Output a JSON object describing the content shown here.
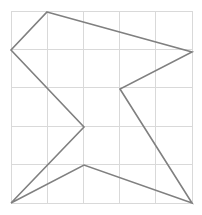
{
  "figure": {
    "name": "polygon-on-grid",
    "width": 202,
    "height": 215,
    "background_color": "#ffffff"
  },
  "chart_data": {
    "type": "scatter",
    "title": "",
    "subtitle": "",
    "xlabel": "",
    "ylabel": "",
    "grid": true,
    "legend": null,
    "legend_position": "none",
    "xlim": [
      0,
      5
    ],
    "ylim": [
      0,
      5
    ],
    "xticks": [
      0,
      1,
      2,
      3,
      4,
      5
    ],
    "yticks": [
      0,
      1,
      2,
      3,
      4,
      5
    ],
    "xticklabels": [
      "",
      "",
      "",
      "",
      "",
      ""
    ],
    "yticklabels": [
      "",
      "",
      "",
      "",
      "",
      ""
    ],
    "plot_area": {
      "left": 11,
      "top": 11,
      "right": 192,
      "bottom": 203,
      "columns": 5,
      "rows": 5,
      "cell_width": 36.2,
      "cell_height": 38.4
    },
    "grid_style": {
      "color": "#d9d9d9",
      "width": 1,
      "show_vertical": true,
      "show_horizontal": true,
      "vertical_x": [
        11,
        47.2,
        83.4,
        119.6,
        155.8,
        192
      ],
      "horizontal_y": [
        11,
        49.4,
        87.8,
        126.2,
        164.6,
        203
      ]
    },
    "series": [
      {
        "name": "polygon",
        "type": "closed-polyline",
        "closed": true,
        "fill": "none",
        "stroke": "#808080",
        "stroke_width": 1.6,
        "point_count": 8,
        "points_px": [
          [
            47,
            12
          ],
          [
            192,
            52
          ],
          [
            120,
            89
          ],
          [
            192,
            203
          ],
          [
            84,
            165
          ],
          [
            11,
            203
          ],
          [
            84,
            127
          ],
          [
            11,
            50
          ]
        ],
        "points_grid": [
          [
            1.0,
            4.97
          ],
          [
            5.0,
            3.94
          ],
          [
            3.0,
            3.0
          ],
          [
            5.0,
            0.0
          ],
          [
            2.02,
            0.99
          ],
          [
            0.0,
            0.0
          ],
          [
            2.02,
            1.98
          ],
          [
            0.0,
            3.98
          ]
        ],
        "x_px": [
          47,
          192,
          120,
          192,
          84,
          11,
          84,
          11
        ],
        "y_px": [
          12,
          52,
          89,
          203,
          165,
          203,
          127,
          50
        ]
      }
    ]
  }
}
